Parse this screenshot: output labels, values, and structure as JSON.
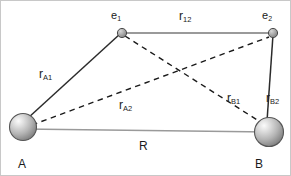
{
  "figure": {
    "colors": {
      "background": "#ffffff",
      "border": "#c8c8c8",
      "solid_line": "#9a9a9a",
      "bond_line": "#2b2b2b",
      "dashed_line": "#1a1a1a",
      "sphere_light": "#f2f2f2",
      "sphere_mid": "#bdbdbd",
      "sphere_dark": "#808080",
      "sphere_outline": "#4d4d4d",
      "electron_fill": "#9e9e9e",
      "electron_outline": "#4a4a4a",
      "text": "#1a1a1a"
    }
  },
  "nodes": [
    {
      "id": "A",
      "label": "A",
      "sub": "",
      "type": "nucleus",
      "x": 22,
      "y": 126,
      "r": 13.5,
      "label_x": 17,
      "label_y": 157
    },
    {
      "id": "B",
      "label": "B",
      "sub": "",
      "type": "nucleus",
      "x": 268,
      "y": 131,
      "r": 14.5,
      "label_x": 254,
      "label_y": 157
    },
    {
      "id": "e1",
      "label": "e",
      "sub": "1",
      "type": "electron",
      "x": 121,
      "y": 32,
      "r": 4.5,
      "label_x": 110,
      "label_y": 9
    },
    {
      "id": "e2",
      "label": "e",
      "sub": "2",
      "type": "electron",
      "x": 272,
      "y": 32,
      "r": 4.5,
      "label_x": 261,
      "label_y": 9
    }
  ],
  "edges": [
    {
      "id": "rA1",
      "label": "r",
      "sub": "A1",
      "from": "A",
      "to": "e1",
      "style": "solid-dark",
      "label_x": 38,
      "label_y": 67
    },
    {
      "id": "rA2",
      "label": "r",
      "sub": "A2",
      "from": "A",
      "to": "e2",
      "style": "dashed",
      "label_x": 118,
      "label_y": 98
    },
    {
      "id": "rB1",
      "label": "r",
      "sub": "B1",
      "from": "e1",
      "to": "B",
      "style": "dashed",
      "label_x": 226,
      "label_y": 91
    },
    {
      "id": "rB2",
      "label": "r",
      "sub": "B2",
      "from": "e2",
      "to": "B",
      "style": "solid-dark",
      "label_x": 265,
      "label_y": 91
    },
    {
      "id": "r12",
      "label": "r",
      "sub": "12",
      "from": "e1",
      "to": "e2",
      "style": "solid-gray",
      "label_x": 178,
      "label_y": 9
    },
    {
      "id": "R",
      "label": "R",
      "sub": "",
      "from": "A",
      "to": "B",
      "style": "solid-gray",
      "label_x": 138,
      "label_y": 139
    }
  ]
}
